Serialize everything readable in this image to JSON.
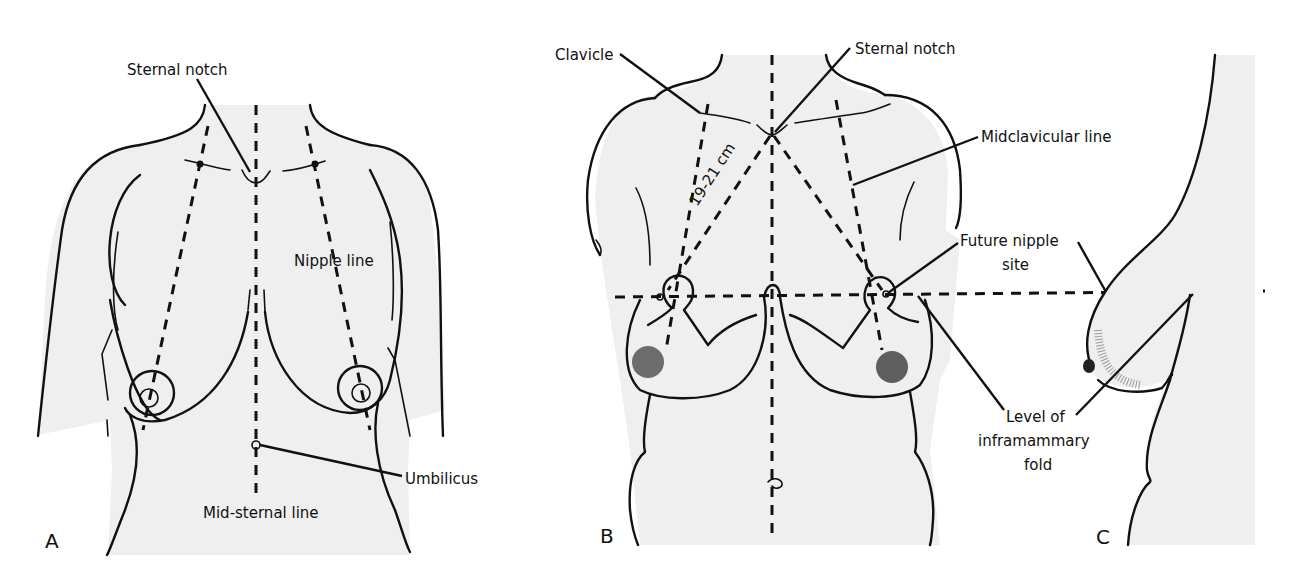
{
  "figure": {
    "panels": [
      {
        "id": "A",
        "letter": "A",
        "labels": {
          "sternal_notch": "Sternal notch",
          "nipple_line": "Nipple line",
          "umbilicus": "Umbilicus",
          "mid_sternal_line": "Mid-sternal line"
        }
      },
      {
        "id": "B",
        "letter": "B",
        "labels": {
          "clavicle": "Clavicle",
          "sternal_notch": "Sternal notch",
          "midclavicular_line": "Midclavicular line",
          "measurement": "19-21 cm",
          "future_nipple_site_1": "Future nipple",
          "future_nipple_site_2": "site",
          "inframammary_1": "Level of",
          "inframammary_2": "inframammary",
          "inframammary_3": "fold"
        }
      },
      {
        "id": "C",
        "letter": "C"
      }
    ],
    "colors": {
      "line": "#111111",
      "skin": "#efefef",
      "background": "#ffffff"
    }
  }
}
